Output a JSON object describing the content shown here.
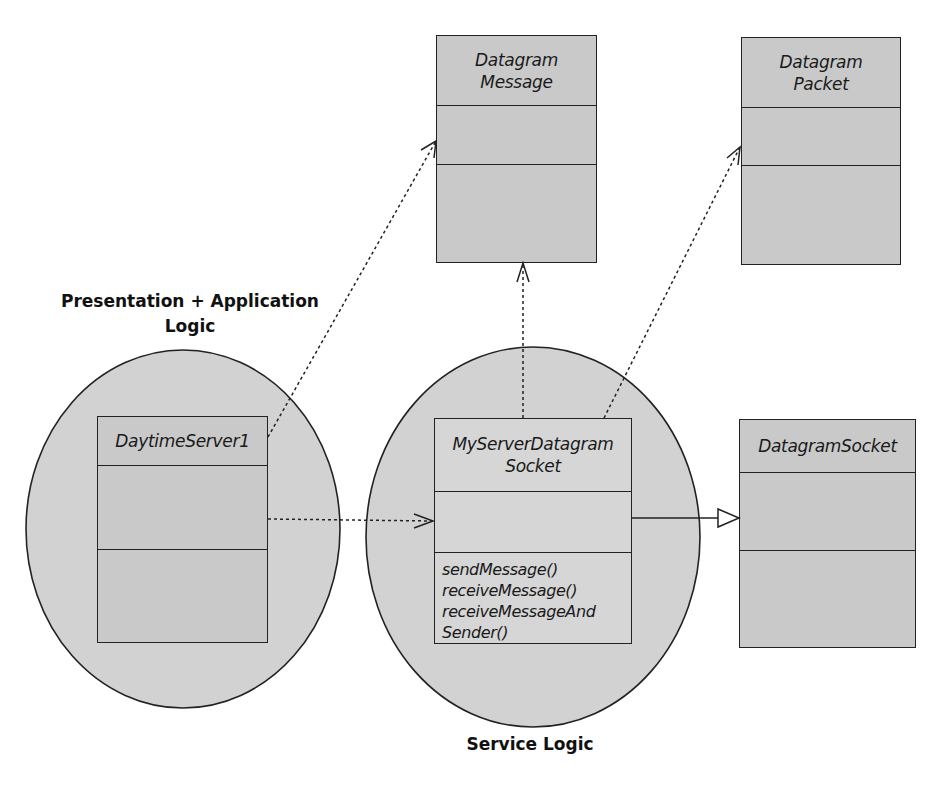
{
  "diagram": {
    "type": "UML class diagram",
    "regions": [
      {
        "id": "presentation",
        "label": "Presentation + Application\nLogic"
      },
      {
        "id": "service",
        "label": "Service Logic"
      }
    ],
    "classes": {
      "datagram_message": {
        "name": "Datagram\nMessage",
        "operations": []
      },
      "datagram_packet": {
        "name": "Datagram\nPacket",
        "operations": []
      },
      "daytime_server": {
        "name": "DaytimeServer1",
        "operations": []
      },
      "my_server_datagram_socket": {
        "name": "MyServerDatagram\nSocket",
        "operations": [
          "sendMessage()",
          "receiveMessage()",
          "receiveMessageAnd",
          "Sender()"
        ]
      },
      "datagram_socket": {
        "name": "DatagramSocket",
        "operations": []
      }
    },
    "relationships": [
      {
        "from": "DaytimeServer1",
        "to": "Datagram Message",
        "kind": "dependency"
      },
      {
        "from": "DaytimeServer1",
        "to": "MyServerDatagram Socket",
        "kind": "dependency"
      },
      {
        "from": "MyServerDatagram Socket",
        "to": "Datagram Message",
        "kind": "dependency"
      },
      {
        "from": "MyServerDatagram Socket",
        "to": "Datagram Packet",
        "kind": "dependency"
      },
      {
        "from": "MyServerDatagram Socket",
        "to": "DatagramSocket",
        "kind": "generalization"
      }
    ],
    "colors": {
      "box_fill": "#c9c9c9",
      "region_fill": "#d2d2d2",
      "line": "#222222",
      "background": "#ffffff"
    }
  }
}
